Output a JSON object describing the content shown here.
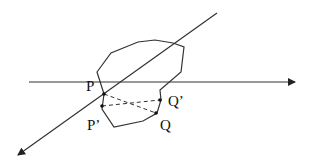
{
  "diagram": {
    "labels": {
      "P": "P",
      "P_prime": "P’",
      "Q": "Q",
      "Q_prime": "Q’"
    },
    "colors": {
      "stroke": "#333333",
      "background": "#ffffff"
    }
  }
}
